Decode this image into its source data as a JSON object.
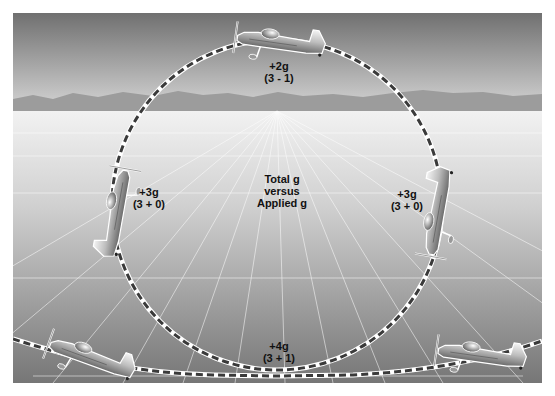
{
  "diagram": {
    "title_visible": "Total g versus Applied g",
    "labels": {
      "top": {
        "line1": "+2g",
        "line2": "(3 - 1)"
      },
      "left": {
        "line1": "+3g",
        "line2": "(3 + 0)"
      },
      "right": {
        "line1": "+3g",
        "line2": "(3 + 0)"
      },
      "bottom": {
        "line1": "+4g",
        "line2": "(3 + 1)"
      },
      "center": {
        "line1": "Total g",
        "line2": "versus",
        "line3": "Applied g"
      }
    },
    "airplanes": [
      {
        "position": "top",
        "attitude": "inverted"
      },
      {
        "position": "left",
        "attitude": "nose-up-vertical"
      },
      {
        "position": "right",
        "attitude": "nose-down-vertical"
      },
      {
        "position": "bottom-left",
        "attitude": "nose-up-climb"
      },
      {
        "position": "bottom-right",
        "attitude": "level-exit"
      }
    ],
    "colors": {
      "sky_top": "#6e6e6e",
      "sky_horizon": "#d8d8d8",
      "mountains": "#9a9a9a",
      "ground_near": "#7a7a7a",
      "ground_far": "#f0f0f0",
      "path_dash": "#3a3a3a",
      "path_gap": "#ffffff"
    }
  }
}
